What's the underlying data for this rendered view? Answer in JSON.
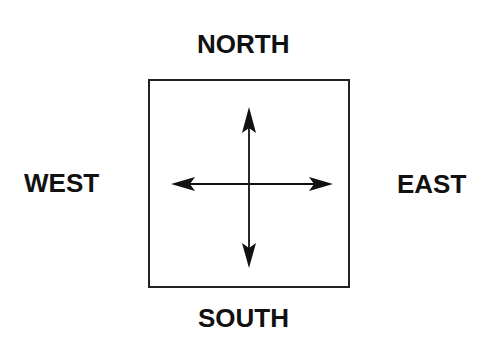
{
  "diagram": {
    "labels": {
      "north": "NORTH",
      "south": "SOUTH",
      "west": "WEST",
      "east": "EAST"
    },
    "colors": {
      "stroke": "#222222",
      "text": "#111111",
      "background": "#ffffff"
    },
    "box": {
      "x": 149,
      "y": 80,
      "width": 200,
      "height": 207
    },
    "arrows": [
      {
        "direction": "north"
      },
      {
        "direction": "south"
      },
      {
        "direction": "west"
      },
      {
        "direction": "east"
      }
    ]
  }
}
